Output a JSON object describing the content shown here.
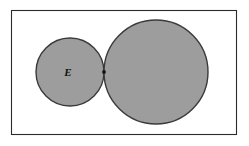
{
  "figure": {
    "canvas": {
      "width": 249,
      "height": 146,
      "background": "#ffffff"
    },
    "frame": {
      "name": "outer-rectangle",
      "x": 11,
      "y": 10,
      "width": 226,
      "height": 125,
      "fill": "#ffffff",
      "stroke": "#2b2b2b",
      "stroke_width": 1.1
    },
    "colors": {
      "disk_fill": "#9d9d9d",
      "disk_stroke": "#3a3a3a",
      "frame_stroke": "#2b2b2b",
      "label_color": "#111111",
      "dot_color": "#141414",
      "background": "#ffffff"
    },
    "shapes": [
      {
        "name": "small-disk",
        "type": "circle",
        "cx": 70,
        "cy": 72,
        "r": 34,
        "fill": "#9d9d9d",
        "stroke": "#3a3a3a"
      },
      {
        "name": "large-disk",
        "type": "circle",
        "cx": 156,
        "cy": 72,
        "r": 52,
        "fill": "#9d9d9d",
        "stroke": "#3a3a3a"
      }
    ],
    "markers": [
      {
        "name": "tangency-point",
        "type": "dot",
        "cx": 104,
        "cy": 72,
        "r": 1.9,
        "fill": "#141414"
      }
    ],
    "labels": [
      {
        "name": "label-E",
        "text": "E",
        "x": 68,
        "y": 72,
        "style": "bold-italic-serif",
        "font_size": 11
      }
    ]
  }
}
